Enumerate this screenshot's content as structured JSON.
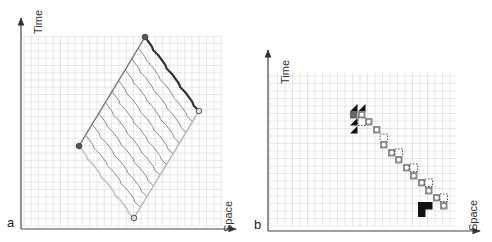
{
  "panels": [
    {
      "letter": "a",
      "x_axis_label": "Space",
      "y_axis_label": "Time",
      "grid": {
        "x0": 24,
        "y0": 36,
        "x1": 222,
        "y1": 226,
        "cell": 7.3
      },
      "axes": {
        "origin": [
          21,
          229
        ],
        "x_end": 236,
        "y_end": 18
      },
      "endpoints": [
        {
          "name": "top",
          "x": 145,
          "y": 37,
          "fill": "#555555"
        },
        {
          "name": "right",
          "x": 199,
          "y": 111,
          "fill": "#dddddd"
        },
        {
          "name": "left",
          "x": 79,
          "y": 146,
          "fill": "#555555"
        },
        {
          "name": "bottom",
          "x": 134,
          "y": 218,
          "fill": "#dddddd"
        }
      ],
      "colors": {
        "lines": "#8a8a8a",
        "edge_dark": "#333333",
        "edge_light": "#c8c8c8"
      }
    },
    {
      "letter": "b",
      "x_axis_label": "Space",
      "y_axis_label": "Time",
      "grid": {
        "x0": 270,
        "y0": 73,
        "x1": 456,
        "y1": 226,
        "cell": 7.5
      },
      "axes": {
        "origin": [
          268,
          231
        ],
        "x_end": 480,
        "y_end": 50
      },
      "colors": {
        "black": "#111111",
        "gray": "#8c8c8c",
        "dark_gray": "#666666"
      }
    }
  ]
}
